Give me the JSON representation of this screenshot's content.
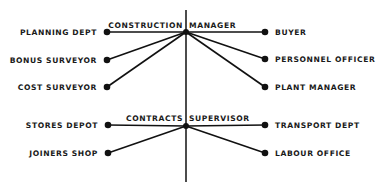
{
  "diagram": {
    "type": "organisation-chart",
    "spine": {
      "x": 186,
      "y1": 10,
      "y2": 182
    },
    "hubs": [
      {
        "id": "construction-manager",
        "label": "CONSTRUCTION MANAGER",
        "x": 186,
        "y": 32,
        "label_x": 186,
        "label_y": 28,
        "left": [
          {
            "label": "PLANNING DEPT",
            "dot_x": 107,
            "dot_y": 32
          },
          {
            "label": "BONUS SURVEYOR",
            "dot_x": 107,
            "dot_y": 60
          },
          {
            "label": "COST SURVEYOR",
            "dot_x": 107,
            "dot_y": 87
          }
        ],
        "right": [
          {
            "label": "BUYER",
            "dot_x": 265,
            "dot_y": 32
          },
          {
            "label": "PERSONNEL OFFICER",
            "dot_x": 265,
            "dot_y": 59
          },
          {
            "label": "PLANT MANAGER",
            "dot_x": 265,
            "dot_y": 87
          }
        ]
      },
      {
        "id": "contracts-supervisor",
        "label": "CONTRACTS SUPERVISOR",
        "x": 186,
        "y": 126,
        "label_x": 186,
        "label_y": 121,
        "left": [
          {
            "label": "STORES DEPOT",
            "dot_x": 108,
            "dot_y": 125
          },
          {
            "label": "JOINERS SHOP",
            "dot_x": 108,
            "dot_y": 153
          }
        ],
        "right": [
          {
            "label": "TRANSPORT DEPT",
            "dot_x": 265,
            "dot_y": 125
          },
          {
            "label": "LABOUR OFFICE",
            "dot_x": 265,
            "dot_y": 153
          }
        ]
      }
    ]
  },
  "colors": {
    "ink": "#111111",
    "background": "#ffffff"
  }
}
